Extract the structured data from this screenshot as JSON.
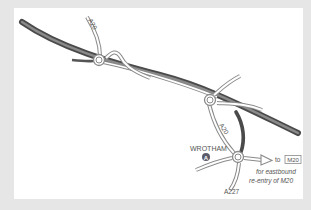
{
  "map": {
    "roads": {
      "motorway": "M20",
      "a20_north": "A20",
      "a20_south": "A20",
      "a227": "A227"
    },
    "places": {
      "wrotham": "WROTHAM",
      "wrotham_marker": "A"
    },
    "directions": {
      "to_label": "to",
      "destination_shield": "M20",
      "note_line1": "for eastbound",
      "note_line2": "re-entry of M20"
    },
    "colors": {
      "motorway": "#6f6f6f",
      "motorway_edge": "#4a4a4a",
      "road_outline": "#8a8a8a",
      "road_fill": "#ffffff",
      "text": "#555555",
      "marker": "#5a5a6a",
      "frame": "#e6e6e6",
      "panel": "#ffffff"
    }
  }
}
